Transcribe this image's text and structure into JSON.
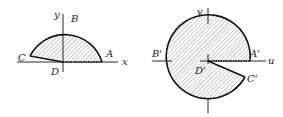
{
  "figures": [
    {
      "id": "z-plane",
      "points": {
        "A": "A",
        "B": "B",
        "C": "C",
        "D": "D"
      },
      "axes": {
        "x": "x",
        "y": "y"
      }
    },
    {
      "id": "w-plane",
      "points": {
        "A": "A'",
        "B": "B'",
        "C": "C'",
        "D": "D'"
      },
      "axes": {
        "u": "u",
        "v": "v"
      }
    }
  ],
  "colors": {
    "stroke": "#111111",
    "hatch": "#555555"
  }
}
